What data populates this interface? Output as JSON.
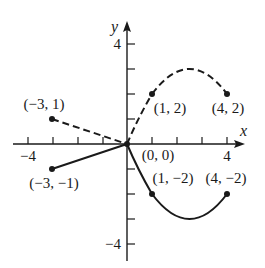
{
  "figure": {
    "axis_labels": {
      "x": "x",
      "y": "y"
    },
    "x_ticks": [
      {
        "value": -4,
        "label": "−4"
      },
      {
        "value": -3,
        "label": ""
      },
      {
        "value": -2,
        "label": ""
      },
      {
        "value": -1,
        "label": ""
      },
      {
        "value": 1,
        "label": ""
      },
      {
        "value": 2,
        "label": ""
      },
      {
        "value": 3,
        "label": ""
      },
      {
        "value": 4,
        "label": "4"
      }
    ],
    "y_ticks": [
      {
        "value": 4,
        "label": "4"
      },
      {
        "value": 3,
        "label": ""
      },
      {
        "value": 2,
        "label": ""
      },
      {
        "value": 1,
        "label": ""
      },
      {
        "value": -1,
        "label": ""
      },
      {
        "value": -2,
        "label": ""
      },
      {
        "value": -3,
        "label": ""
      },
      {
        "value": -4,
        "label": "−4"
      }
    ],
    "points": [
      {
        "id": "p-neg3-1",
        "x": -3,
        "y": 1,
        "label": "(−3, 1)"
      },
      {
        "id": "p-1-2",
        "x": 1,
        "y": 2,
        "label": "(1, 2)"
      },
      {
        "id": "p-4-2",
        "x": 4,
        "y": 2,
        "label": "(4, 2)"
      },
      {
        "id": "p-0-0",
        "x": 0,
        "y": 0,
        "label": "(0, 0)"
      },
      {
        "id": "p-neg3-neg1",
        "x": -3,
        "y": -1,
        "label": "(−3, −1)"
      },
      {
        "id": "p-1-neg2",
        "x": 1,
        "y": -2,
        "label": "(1, −2)"
      },
      {
        "id": "p-4-neg2",
        "x": 4,
        "y": -2,
        "label": "(4, −2)"
      }
    ],
    "curves": [
      {
        "name": "dashed-segment",
        "style": "dashed",
        "from": [
          -3,
          1
        ],
        "to": [
          0,
          0
        ]
      },
      {
        "name": "dashed-rise",
        "style": "dashed",
        "from": [
          0,
          0
        ],
        "to": [
          1,
          2
        ]
      },
      {
        "name": "dashed-arc",
        "style": "dashed",
        "from": [
          1,
          2
        ],
        "to": [
          4,
          2
        ],
        "peak": [
          2.5,
          3
        ]
      },
      {
        "name": "solid-segment",
        "style": "solid",
        "from": [
          -3,
          -1
        ],
        "to": [
          0,
          0
        ]
      },
      {
        "name": "solid-drop",
        "style": "solid",
        "from": [
          0,
          0
        ],
        "to": [
          1,
          -2
        ]
      },
      {
        "name": "solid-arc",
        "style": "solid",
        "from": [
          1,
          -2
        ],
        "to": [
          4,
          -2
        ],
        "trough": [
          2.5,
          -3
        ]
      }
    ],
    "colors": {
      "ink": "#1a1a1a",
      "background": "#ffffff"
    }
  }
}
